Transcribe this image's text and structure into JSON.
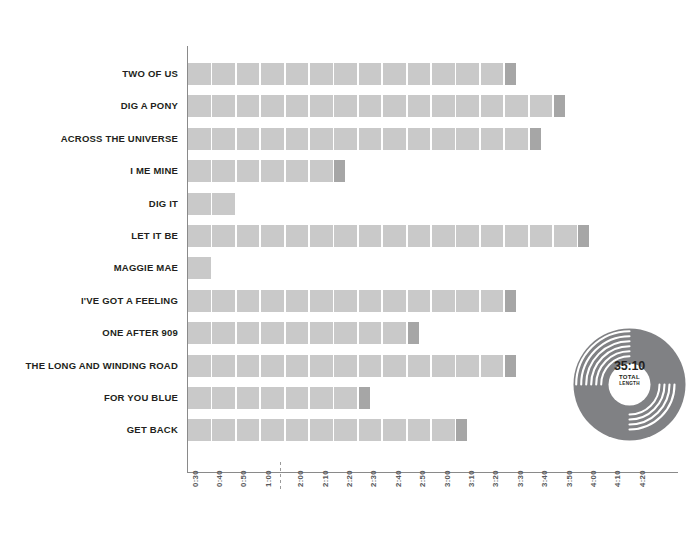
{
  "chart_data": {
    "type": "bar",
    "orientation": "horizontal",
    "title": "",
    "xlabel": "",
    "ylabel": "",
    "grid": false,
    "legend": false,
    "axis_break_between": [
      "1:00",
      "2:00"
    ],
    "xticks": [
      "0:30",
      "0:40",
      "0:50",
      "1:00",
      "2:00",
      "2:10",
      "2:20",
      "2:30",
      "2:40",
      "2:50",
      "3:00",
      "3:10",
      "3:20",
      "3:30",
      "3:40",
      "3:50",
      "4:00",
      "4:10",
      "4:20"
    ],
    "categories": [
      "TWO OF US",
      "DIG A PONY",
      "ACROSS THE UNIVERSE",
      "I ME MINE",
      "DIG IT",
      "LET IT BE",
      "MAGGIE MAE",
      "I'VE GOT A FEELING",
      "ONE AFTER 909",
      "THE LONG AND WINDING ROAD",
      "FOR YOU BLUE",
      "GET BACK"
    ],
    "values": [
      "3:37",
      "3:54",
      "3:48",
      "2:26",
      "0:50",
      "4:03",
      "0:40",
      "3:37",
      "2:54",
      "3:38",
      "2:32",
      "3:09"
    ],
    "values_seconds": [
      217,
      234,
      228,
      146,
      50,
      243,
      40,
      217,
      174,
      218,
      152,
      189
    ],
    "bars": [
      {
        "label": "TWO OF US",
        "value": "3:37",
        "segments": 13,
        "tail": 1
      },
      {
        "label": "DIG A PONY",
        "value": "3:54",
        "segments": 15,
        "tail": 1
      },
      {
        "label": "ACROSS THE UNIVERSE",
        "value": "3:48",
        "segments": 14,
        "tail": 1
      },
      {
        "label": "I ME MINE",
        "value": "2:26",
        "segments": 6,
        "tail": 1
      },
      {
        "label": "DIG IT",
        "value": "0:50",
        "segments": 2,
        "tail": 0
      },
      {
        "label": "LET IT BE",
        "value": "4:03",
        "segments": 16,
        "tail": 1
      },
      {
        "label": "MAGGIE MAE",
        "value": "0:40",
        "segments": 1,
        "tail": 0
      },
      {
        "label": "I'VE GOT A FEELING",
        "value": "3:37",
        "segments": 13,
        "tail": 1
      },
      {
        "label": "ONE AFTER 909",
        "value": "2:54",
        "segments": 9,
        "tail": 1
      },
      {
        "label": "THE LONG AND WINDING ROAD",
        "value": "3:38",
        "segments": 13,
        "tail": 1
      },
      {
        "label": "FOR YOU BLUE",
        "value": "2:32",
        "segments": 7,
        "tail": 1
      },
      {
        "label": "GET BACK",
        "value": "3:09",
        "segments": 11,
        "tail": 1
      }
    ],
    "colors": {
      "bar": "#c9c9c9",
      "bar_tail": "#a6a6a6",
      "axis": "#8a8a8a",
      "label": "#231f20",
      "tick": "#58595b",
      "vinyl": "#808184",
      "background": "#ffffff"
    }
  },
  "summary": {
    "total_time": "35:10",
    "total_label": "TOTAL",
    "length_label": "LENGTH"
  }
}
